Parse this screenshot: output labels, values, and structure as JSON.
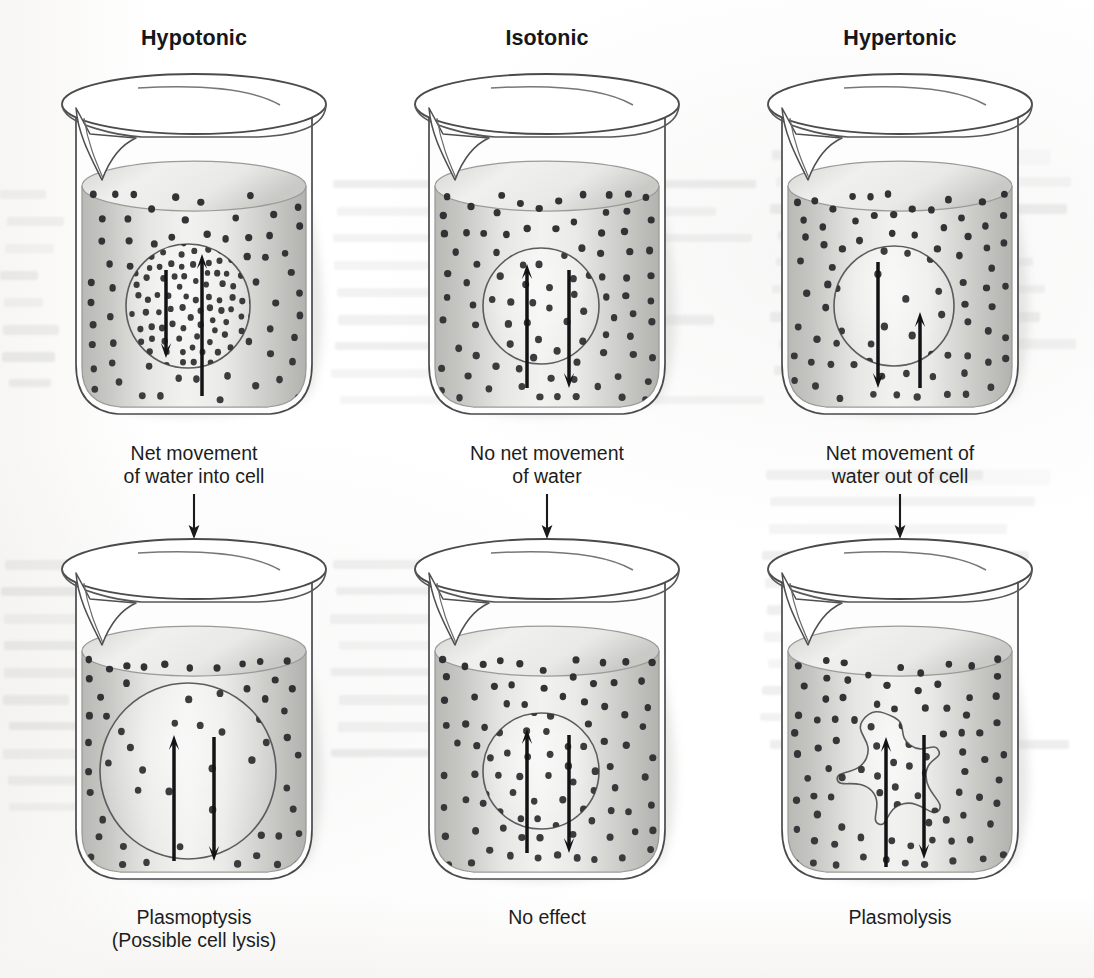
{
  "figure": {
    "domain_kind": "biology-diagram",
    "rows": 2,
    "columns": 3
  },
  "columns": [
    {
      "id": "hypotonic",
      "header": "Hypotonic",
      "x": 14,
      "top_state": {
        "cell_shape": "circle",
        "cell_radius": 62,
        "dots_outside_density": "low",
        "dots_inside_density": "high",
        "arrow_in_length": "long",
        "arrow_out_length": "short"
      },
      "mid_caption": "Net movement\nof water into cell",
      "bottom_state": {
        "cell_shape": "circle",
        "cell_radius": 86,
        "dots_outside_density": "low",
        "dots_inside_density": "low",
        "arrow_in_length": "long",
        "arrow_out_length": "short"
      },
      "bottom_caption": "Plasmoptysis\n(Possible cell lysis)"
    },
    {
      "id": "isotonic",
      "header": "Isotonic",
      "x": 367,
      "top_state": {
        "cell_shape": "circle",
        "cell_radius": 58,
        "dots_outside_density": "medium",
        "dots_inside_density": "medium",
        "arrow_in_length": "equal",
        "arrow_out_length": "equal"
      },
      "mid_caption": "No net movement\nof water",
      "bottom_state": {
        "cell_shape": "circle",
        "cell_radius": 58,
        "dots_outside_density": "medium",
        "dots_inside_density": "medium",
        "arrow_in_length": "equal",
        "arrow_out_length": "equal"
      },
      "bottom_caption": "No effect"
    },
    {
      "id": "hypertonic",
      "header": "Hypertonic",
      "x": 720,
      "top_state": {
        "cell_shape": "circle",
        "cell_radius": 60,
        "dots_outside_density": "high",
        "dots_inside_density": "low",
        "arrow_in_length": "short",
        "arrow_out_length": "long"
      },
      "mid_caption": "Net movement of\nwater out of cell",
      "bottom_state": {
        "cell_shape": "crenated-blob",
        "cell_radius": 44,
        "dots_outside_density": "high",
        "dots_inside_density": "medium",
        "arrow_in_length": "long",
        "arrow_out_length": "short"
      },
      "bottom_caption": "Plasmolysis"
    }
  ],
  "legend_semantics": {
    "dot_meaning": "solute particle",
    "arrow_up_meaning": "water moving into cell",
    "arrow_down_meaning": "water moving out of cell",
    "container": "beaker"
  },
  "colors": {
    "background": "#ffffff",
    "glass_outline": "#4a4a4d",
    "liquid_light": "#f2f2f1",
    "liquid_mid": "#d8d8d6",
    "liquid_dark": "#b9b9b6",
    "solute_dot": "#2c2c2f",
    "cell_outline": "#5c5c5f",
    "arrow": "#131316",
    "text": "#17171a",
    "shadow": "#c9c9c6"
  }
}
